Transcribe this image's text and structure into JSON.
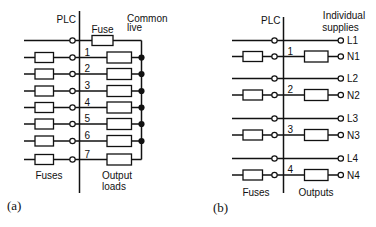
{
  "figure": {
    "background_color": "#ffffff",
    "ink_color": "#111111"
  },
  "diagram_a": {
    "plc_label": "PLC",
    "fuse_label": "Fuse",
    "common_live_line1": "Common",
    "common_live_line2": "live",
    "channel_numbers": [
      "1",
      "2",
      "3",
      "4",
      "5",
      "6",
      "7"
    ],
    "fuses_label": "Fuses",
    "output_loads_line1": "Output",
    "output_loads_line2": "loads",
    "caption": "(a)"
  },
  "diagram_b": {
    "plc_label": "PLC",
    "individual_supplies_line1": "Individual",
    "individual_supplies_line2": "supplies",
    "channel_numbers": [
      "1",
      "2",
      "3",
      "4"
    ],
    "terminal_labels": [
      "L1",
      "N1",
      "L2",
      "N2",
      "L3",
      "N3",
      "L4",
      "N4"
    ],
    "fuses_label": "Fuses",
    "outputs_label": "Outputs",
    "caption": "(b)"
  }
}
